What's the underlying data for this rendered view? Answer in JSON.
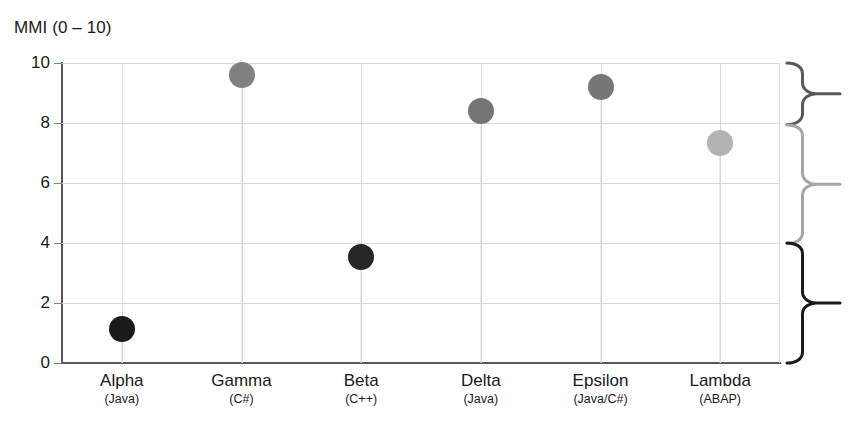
{
  "chart_data": {
    "type": "scatter",
    "title": "MMI (0 – 10)",
    "xlabel": "",
    "ylabel": "MMI (0 – 10)",
    "ylim": [
      0,
      10
    ],
    "yticks": [
      0,
      2,
      4,
      6,
      8,
      10
    ],
    "grid": true,
    "legend": "none",
    "categories": [
      "Alpha",
      "Gamma",
      "Beta",
      "Delta",
      "Epsilon",
      "Lambda"
    ],
    "category_sublabels": [
      "(Java)",
      "(C#)",
      "(C++)",
      "(Java)",
      "(Java/C#)",
      "(ABAP)"
    ],
    "values": [
      1.15,
      9.6,
      3.55,
      8.4,
      9.2,
      7.35
    ],
    "point_colors": [
      "#1a1a1a",
      "#808080",
      "#262626",
      "#757575",
      "#777777",
      "#b3b3b3"
    ],
    "points": [
      {
        "category": "Alpha",
        "sublabel": "(Java)",
        "value": 1.15,
        "color": "#1a1a1a"
      },
      {
        "category": "Gamma",
        "sublabel": "(C#)",
        "value": 9.6,
        "color": "#808080"
      },
      {
        "category": "Beta",
        "sublabel": "(C++)",
        "value": 3.55,
        "color": "#262626"
      },
      {
        "category": "Delta",
        "sublabel": "(Java)",
        "value": 8.4,
        "color": "#757575"
      },
      {
        "category": "Epsilon",
        "sublabel": "(Java/C#)",
        "value": 9.2,
        "color": "#777777"
      },
      {
        "category": "Lambda",
        "sublabel": "(ABAP)",
        "value": 7.35,
        "color": "#b3b3b3"
      }
    ],
    "annotations": {
      "braces": [
        {
          "name": "top-band",
          "from": 10.0,
          "to": 7.95,
          "color": "#595959"
        },
        {
          "name": "middle-band",
          "from": 7.95,
          "to": 4.0,
          "color": "#a6a6a6"
        },
        {
          "name": "bottom-band",
          "from": 4.0,
          "to": 0.0,
          "color": "#1a1a1a"
        }
      ]
    },
    "colors": {
      "grid": "#d9d9d9",
      "axis": "#595959",
      "text": "#1a1a1a",
      "background": "#ffffff"
    }
  }
}
